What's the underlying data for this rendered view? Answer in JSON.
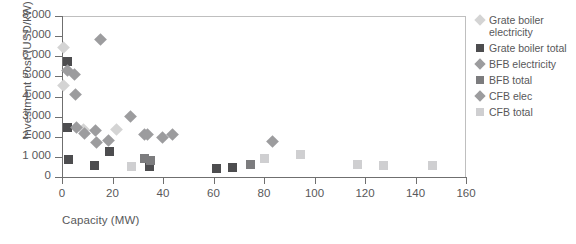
{
  "chart_data": {
    "type": "scatter",
    "title": "",
    "xlabel": "Capacity (MW)",
    "ylabel": "Investment cost (USD/kW)",
    "xlim": [
      0,
      160
    ],
    "ylim": [
      0,
      8000
    ],
    "xticks": [
      "0",
      "20",
      "40",
      "60",
      "80",
      "100",
      "120",
      "140",
      "160"
    ],
    "yticks": [
      "0",
      "1 000",
      "2 000",
      "3 000",
      "4 000",
      "5 000",
      "6 000",
      "7 000",
      "8 000"
    ],
    "grid": false,
    "legend_position": "right",
    "series": [
      {
        "name": "Grate boiler electricity",
        "marker": "diamond",
        "color": "#d4d4d4",
        "points": [
          {
            "x": 0.5,
            "y": 6430
          },
          {
            "x": 0.5,
            "y": 4560
          },
          {
            "x": 8.5,
            "y": 2350
          },
          {
            "x": 21.5,
            "y": 2370
          }
        ]
      },
      {
        "name": "Grate boiler total",
        "marker": "square",
        "color": "#4d4d4f",
        "points": [
          {
            "x": 2.2,
            "y": 5740
          },
          {
            "x": 2.2,
            "y": 2450
          },
          {
            "x": 2.6,
            "y": 880
          },
          {
            "x": 13.0,
            "y": 570
          },
          {
            "x": 18.8,
            "y": 1250
          },
          {
            "x": 34.8,
            "y": 540
          },
          {
            "x": 61.0,
            "y": 430
          },
          {
            "x": 67.5,
            "y": 480
          },
          {
            "x": 74.8,
            "y": 610
          }
        ]
      },
      {
        "name": "BFB electricity",
        "marker": "diamond",
        "color": "#9c9c9e",
        "points": [
          {
            "x": 2.3,
            "y": 5300
          },
          {
            "x": 4.8,
            "y": 5100
          },
          {
            "x": 5.2,
            "y": 4100
          },
          {
            "x": 15.1,
            "y": 6850
          },
          {
            "x": 5.8,
            "y": 2450
          },
          {
            "x": 9.0,
            "y": 2150
          },
          {
            "x": 13.2,
            "y": 2300
          },
          {
            "x": 13.6,
            "y": 1690
          },
          {
            "x": 18.6,
            "y": 1820
          },
          {
            "x": 27.0,
            "y": 2990
          },
          {
            "x": 32.6,
            "y": 2120
          },
          {
            "x": 34.0,
            "y": 2120
          },
          {
            "x": 39.8,
            "y": 1950
          },
          {
            "x": 43.8,
            "y": 2100
          },
          {
            "x": 83.5,
            "y": 1760
          }
        ]
      },
      {
        "name": "BFB total",
        "marker": "square",
        "color": "#7c7c7e",
        "points": [
          {
            "x": 32.8,
            "y": 910
          },
          {
            "x": 35.2,
            "y": 830
          },
          {
            "x": 74.6,
            "y": 640
          }
        ]
      },
      {
        "name": "CFB elec",
        "marker": "diamond",
        "color": "#9c9c9e",
        "points": []
      },
      {
        "name": "CFB total",
        "marker": "square",
        "color": "#cfcfd1",
        "points": [
          {
            "x": 27.4,
            "y": 540
          },
          {
            "x": 80.0,
            "y": 940
          },
          {
            "x": 94.6,
            "y": 1110
          },
          {
            "x": 117.0,
            "y": 620
          },
          {
            "x": 127.4,
            "y": 590
          },
          {
            "x": 146.6,
            "y": 560
          }
        ]
      }
    ],
    "legend": [
      {
        "label": "Grate boiler electricity",
        "marker": "diamond",
        "color": "#d4d4d4"
      },
      {
        "label": "Grate boiler total",
        "marker": "square",
        "color": "#4d4d4f"
      },
      {
        "label": "BFB electricity",
        "marker": "diamond",
        "color": "#9c9c9e"
      },
      {
        "label": "BFB total",
        "marker": "square",
        "color": "#7c7c7e"
      },
      {
        "label": "CFB elec",
        "marker": "diamond",
        "color": "#9c9c9e"
      },
      {
        "label": "CFB total",
        "marker": "square",
        "color": "#cfcfd1"
      }
    ]
  }
}
